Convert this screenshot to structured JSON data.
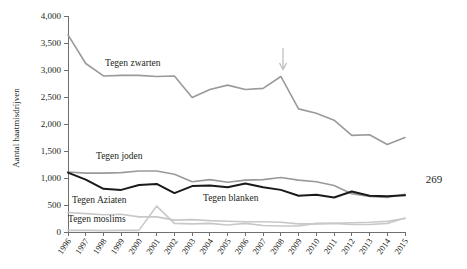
{
  "page": {
    "page_number": "269"
  },
  "chart_data": {
    "type": "line",
    "title": "",
    "xlabel": "",
    "ylabel": "Aantal haatmisdrijven",
    "ylim": [
      0,
      4000
    ],
    "ytick_labels": [
      "0",
      "500",
      "1,000",
      "1,500",
      "2,000",
      "2,500",
      "3,000",
      "3,500",
      "4,000"
    ],
    "ytick_values": [
      0,
      500,
      1000,
      1500,
      2000,
      2500,
      3000,
      3500,
      4000
    ],
    "grid": false,
    "legend_position": "inline-annotations",
    "x": [
      "1996",
      "1997",
      "1998",
      "1999",
      "2000",
      "2001",
      "2002",
      "2003",
      "2004",
      "2005",
      "2006",
      "2007",
      "2008",
      "2009",
      "2010",
      "2011",
      "2012",
      "2013",
      "2014",
      "2015"
    ],
    "series": [
      {
        "name": "Tegen zwarten",
        "color": "#9a9a9a",
        "width": 1.6,
        "values": [
          3650,
          3120,
          2890,
          2900,
          2900,
          2880,
          2890,
          2490,
          2640,
          2720,
          2640,
          2660,
          2880,
          2280,
          2200,
          2070,
          1790,
          1800,
          1620,
          1750
        ]
      },
      {
        "name": "Tegen joden",
        "color": "#9a9a9a",
        "width": 1.6,
        "values": [
          1110,
          1090,
          1090,
          1100,
          1130,
          1130,
          1070,
          930,
          970,
          920,
          960,
          970,
          1010,
          960,
          930,
          860,
          710,
          660,
          640,
          700
        ]
      },
      {
        "name": "Tegen blanken",
        "color": "#1a1a1a",
        "width": 2.0,
        "values": [
          1100,
          970,
          800,
          780,
          870,
          890,
          720,
          850,
          860,
          830,
          900,
          830,
          780,
          670,
          690,
          640,
          750,
          670,
          660,
          680
        ]
      },
      {
        "name": "Tegen Aziaten",
        "color": "#c8c8c8",
        "width": 1.6,
        "values": [
          360,
          340,
          320,
          330,
          280,
          280,
          220,
          230,
          210,
          200,
          190,
          190,
          180,
          150,
          150,
          160,
          170,
          180,
          200,
          250
        ]
      },
      {
        "name": "Tegen moslims",
        "color": "#c8c8c8",
        "width": 1.6,
        "values": [
          30,
          30,
          25,
          30,
          30,
          480,
          160,
          150,
          160,
          130,
          160,
          120,
          110,
          110,
          160,
          160,
          140,
          140,
          160,
          260
        ]
      }
    ],
    "annotations": [
      {
        "name": "arrow-2008",
        "label": "",
        "x": "2008",
        "note": "downward arrow above 2008 peak"
      }
    ],
    "series_labels": [
      {
        "text": "Tegen zwarten",
        "x": 105,
        "y": 66
      },
      {
        "text": "Tegen joden",
        "x": 96,
        "y": 159
      },
      {
        "text": "Tegen blanken",
        "x": 203,
        "y": 201
      },
      {
        "text": "Tegen Aziaten",
        "x": 72,
        "y": 203
      },
      {
        "text": "Tegen moslims",
        "x": 68,
        "y": 222
      }
    ]
  }
}
